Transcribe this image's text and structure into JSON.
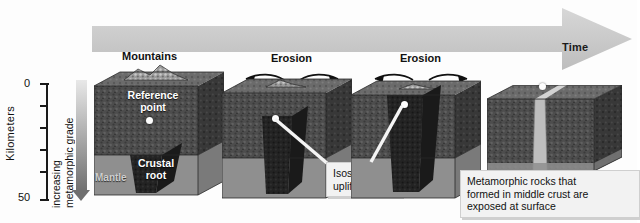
{
  "figure": {
    "time_arrow_label": "Time",
    "axis": {
      "title": "Kilometers",
      "top_value": "0",
      "bottom_value": "50",
      "tick_values": [
        "0",
        "10",
        "20",
        "30",
        "40",
        "50"
      ],
      "gradient_caption": "increasing\nmetamorphic grade",
      "gradient_line1": "increasing",
      "gradient_line2": "metamorphic grade"
    },
    "stages": [
      {
        "id": "stage-1",
        "heading": "Mountains",
        "labels": {
          "reference_point_line1": "Reference",
          "reference_point_line2": "point",
          "crustal_root_line1": "Crustal",
          "crustal_root_line2": "root",
          "mantle": "Mantle"
        }
      },
      {
        "id": "stage-2",
        "heading": "Erosion",
        "callout": "Isostatic\nuplift",
        "callout_line1": "Isostatic",
        "callout_line2": "uplift"
      },
      {
        "id": "stage-3",
        "heading": "Erosion"
      },
      {
        "id": "stage-4",
        "caption_line1": "Metamorphic rocks that",
        "caption_line2": "formed in middle crust are",
        "caption_line3": "exposed at surface"
      }
    ],
    "colors": {
      "background": "#fdfdfd",
      "time_arrow": "#c9c9c9",
      "crust_front": "#4a4a4a",
      "crust_top": "#6e6e6e",
      "crust_side": "#353535",
      "mantle": "#8e8e8e",
      "crustal_root": "#242424",
      "exposed_band": "#b9b9b9",
      "text_dark": "#111111",
      "text_light": "#ffffff"
    }
  }
}
